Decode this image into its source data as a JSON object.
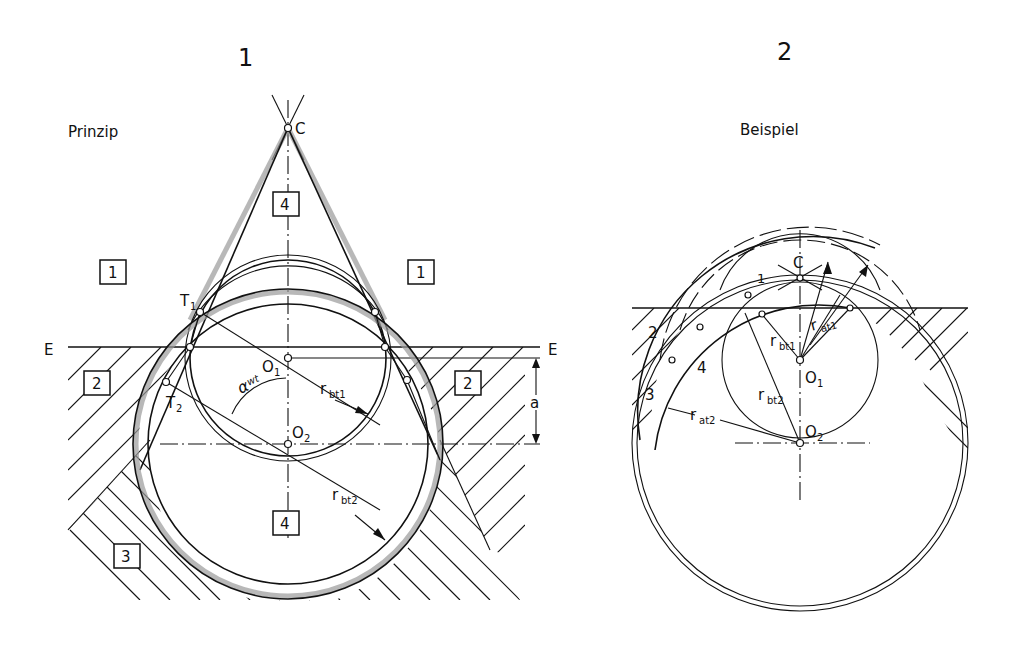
{
  "figure": {
    "panel1": {
      "number": "1",
      "title": "Prinzip",
      "labels": {
        "C": "C",
        "T1": "T",
        "T1_sub": "1",
        "T2": "T",
        "T2_sub": "2",
        "O1": "O",
        "O1_sub": "1",
        "O2": "O",
        "O2_sub": "2",
        "E_left": "E",
        "E_right": "E",
        "alpha": "α",
        "alpha_sub": "wt",
        "rbt1": "r",
        "rbt1_sub": "bt1",
        "rbt2": "r",
        "rbt2_sub": "bt2",
        "a": "a"
      },
      "regions": [
        {
          "id": "region-1-left",
          "label": "1"
        },
        {
          "id": "region-1-right",
          "label": "1"
        },
        {
          "id": "region-2-left",
          "label": "2"
        },
        {
          "id": "region-2-right",
          "label": "2"
        },
        {
          "id": "region-3",
          "label": "3"
        },
        {
          "id": "region-4-top",
          "label": "4"
        },
        {
          "id": "region-4-bottom",
          "label": "4"
        }
      ]
    },
    "panel2": {
      "number": "2",
      "title": "Beispiel",
      "labels": {
        "C": "C",
        "O1": "O",
        "O1_sub": "1",
        "O2": "O",
        "O2_sub": "2",
        "rbt1": "r",
        "rbt1_sub": "bt1",
        "rbt2": "r",
        "rbt2_sub": "bt2",
        "rat1": "r",
        "rat1_sub": "at1",
        "rat2": "r",
        "rat2_sub": "at2",
        "n1": "1",
        "n2": "2",
        "n3": "3",
        "n4": "4"
      }
    }
  }
}
